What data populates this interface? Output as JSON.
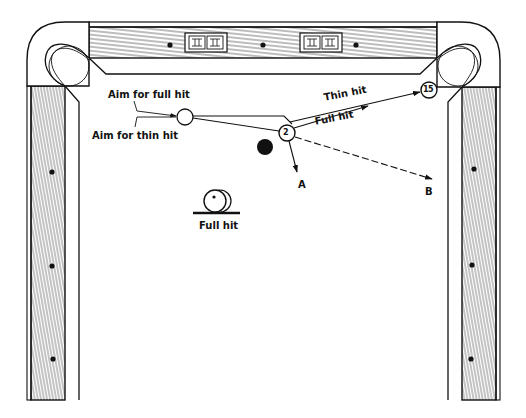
{
  "figure": {
    "colors": {
      "ink": "#111111",
      "paper": "#ffffff"
    },
    "labels": {
      "aim_full": "Aim for full hit",
      "aim_thin": "Aim for thin hit",
      "thin_hit": "Thin hit",
      "full_hit_path": "Full hit",
      "inset_full_hit": "Full hit",
      "point_a": "A",
      "point_b": "B"
    },
    "balls": [
      {
        "id": "cue-ball",
        "label": "",
        "x": 185,
        "y": 117,
        "r": 8,
        "fill": "#ffffff"
      },
      {
        "id": "object-ball-2",
        "label": "2",
        "x": 287,
        "y": 133,
        "r": 8,
        "fill": "#ffffff"
      },
      {
        "id": "object-ball-15",
        "label": "15",
        "x": 429,
        "y": 90,
        "r": 8,
        "fill": "#ffffff"
      },
      {
        "id": "black-ball",
        "label": "",
        "x": 265,
        "y": 147,
        "r": 8,
        "fill": "#111111"
      }
    ],
    "diamonds": {
      "top": [
        [
          170,
          45
        ],
        [
          263,
          45
        ],
        [
          356,
          45
        ]
      ],
      "left": [
        [
          52,
          172
        ],
        [
          52,
          266
        ],
        [
          53,
          359
        ]
      ],
      "right": [
        [
          474,
          169
        ],
        [
          472,
          265
        ],
        [
          471,
          359
        ]
      ]
    }
  }
}
